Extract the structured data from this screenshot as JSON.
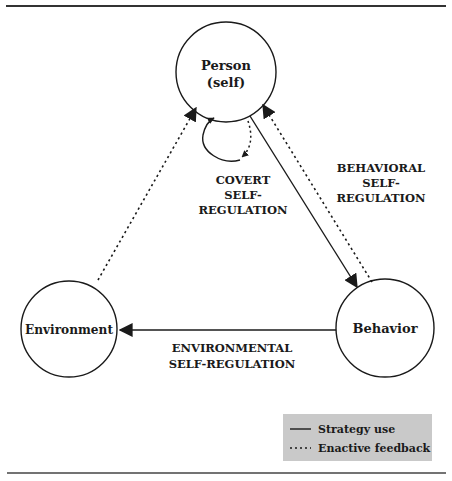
{
  "diagram": {
    "nodes": {
      "person": {
        "line1": "Person",
        "line2": "(self)"
      },
      "environment": {
        "label": "Environment"
      },
      "behavior": {
        "label": "Behavior"
      }
    },
    "labels": {
      "covert": [
        "COVERT",
        "SELF-",
        "REGULATION"
      ],
      "behavioral": [
        "BEHAVIORAL",
        "SELF-",
        "REGULATION"
      ],
      "environmental": [
        "ENVIRONMENTAL",
        "SELF-REGULATION"
      ]
    },
    "legend": {
      "solid": "Strategy use",
      "dashed": "Enactive feedback"
    },
    "edges": [
      {
        "from": "person",
        "to": "behavior",
        "style": "solid",
        "meaning": "Strategy use"
      },
      {
        "from": "behavior",
        "to": "person",
        "style": "dashed",
        "meaning": "Enactive feedback"
      },
      {
        "from": "behavior",
        "to": "environment",
        "style": "solid",
        "meaning": "Strategy use"
      },
      {
        "from": "environment",
        "to": "person",
        "style": "dashed",
        "meaning": "Enactive feedback"
      },
      {
        "from": "person",
        "to": "person",
        "style": "solid-loop",
        "meaning": "Covert self-regulation"
      }
    ],
    "colors": {
      "stroke": "#1a1a1a",
      "legend_bg": "#c9c9c9",
      "rule": "#333333"
    }
  }
}
